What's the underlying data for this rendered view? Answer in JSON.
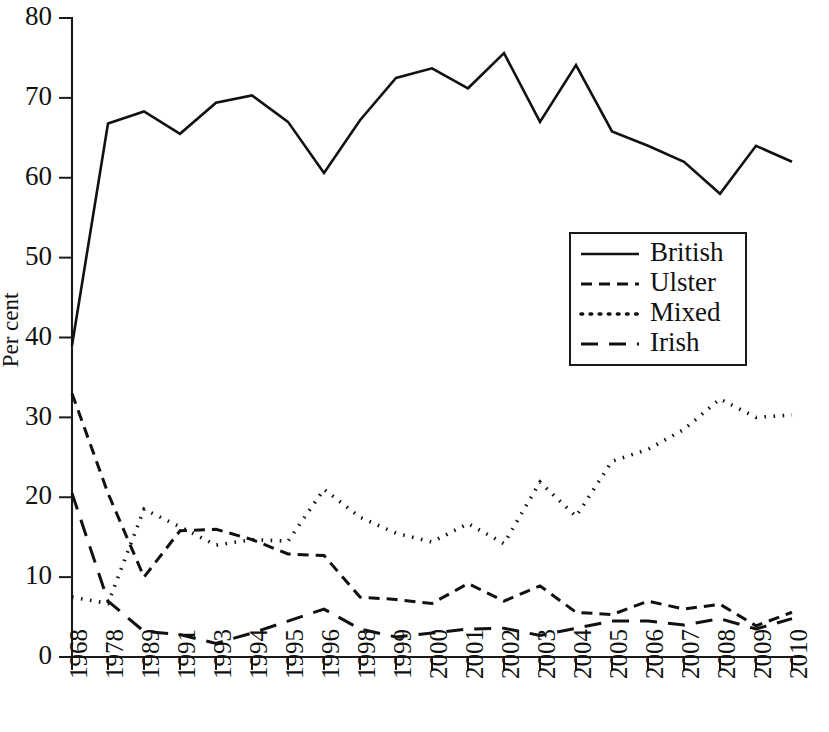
{
  "chart_data": {
    "type": "line",
    "title": "",
    "subtitle": "",
    "xlabel": "",
    "ylabel": "Per cent",
    "ylim": [
      0,
      80
    ],
    "yticks": [
      0,
      10,
      20,
      30,
      40,
      50,
      60,
      70,
      80
    ],
    "grid": false,
    "legend_position": "center-right",
    "categories": [
      "1968",
      "1978",
      "1989",
      "1991",
      "1993",
      "1994",
      "1995",
      "1996",
      "1998",
      "1999",
      "2000",
      "2001",
      "2002",
      "2003",
      "2004",
      "2005",
      "2006",
      "2007",
      "2008",
      "2009",
      "2010"
    ],
    "series": [
      {
        "name": "British",
        "style": "solid",
        "values": [
          39,
          66.8,
          68.3,
          65.5,
          69.4,
          70.3,
          67,
          60.6,
          67.2,
          72.5,
          73.7,
          71.2,
          75.6,
          67,
          74.1,
          65.8,
          64,
          62,
          58,
          64,
          62
        ]
      },
      {
        "name": "Ulster",
        "style": "dashed",
        "values": [
          33,
          20.5,
          10,
          15.8,
          16,
          14.7,
          12.9,
          12.7,
          7.5,
          7.2,
          6.7,
          9.2,
          7,
          8.9,
          5.6,
          5.3,
          7,
          6,
          6.6,
          3.9,
          5.6
        ]
      },
      {
        "name": "Mixed",
        "style": "dotted",
        "values": [
          7.5,
          6.7,
          18.5,
          16.3,
          14,
          14.7,
          14.5,
          21,
          17.5,
          15.5,
          14.4,
          16.7,
          14.2,
          21.9,
          17.6,
          24.5,
          26,
          28.5,
          32.3,
          30,
          30.3
        ]
      },
      {
        "name": "Irish",
        "style": "longdash",
        "values": [
          20.5,
          7,
          3.2,
          2.8,
          1.7,
          3,
          4.5,
          6,
          3.5,
          2.5,
          3,
          3.5,
          3.6,
          2.7,
          3.6,
          4.5,
          4.5,
          4,
          4.8,
          3.5,
          4.8
        ]
      }
    ]
  },
  "legend": {
    "entries": [
      {
        "label": "British"
      },
      {
        "label": "Ulster"
      },
      {
        "label": "Mixed"
      },
      {
        "label": "Irish"
      }
    ]
  },
  "colors": {
    "ink": "#111111",
    "background": "#ffffff"
  }
}
